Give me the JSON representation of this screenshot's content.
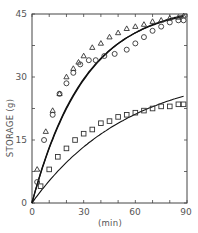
{
  "chart_data": {
    "type": "scatter",
    "title": "",
    "xlabel": "(min)",
    "ylabel": "STORAGE (g)",
    "xlim": [
      0,
      90
    ],
    "ylim": [
      0,
      45
    ],
    "xticks": [
      0,
      30,
      60,
      90
    ],
    "yticks": [
      0,
      15,
      30,
      45
    ],
    "grid": false,
    "legend": null,
    "series": [
      {
        "name": "triangles",
        "marker": "triangle",
        "points": [
          [
            3,
            8
          ],
          [
            8,
            17
          ],
          [
            12,
            22
          ],
          [
            16,
            26
          ],
          [
            20,
            30
          ],
          [
            24,
            32
          ],
          [
            27,
            33.5
          ],
          [
            30,
            35
          ],
          [
            35,
            37
          ],
          [
            40,
            38
          ],
          [
            45,
            39.5
          ],
          [
            50,
            40.5
          ],
          [
            55,
            41.5
          ],
          [
            60,
            42
          ],
          [
            65,
            42.5
          ],
          [
            70,
            43.2
          ],
          [
            75,
            43.5
          ],
          [
            80,
            44
          ],
          [
            85,
            44.2
          ],
          [
            88,
            44.5
          ]
        ]
      },
      {
        "name": "circles",
        "marker": "circle",
        "points": [
          [
            3,
            5
          ],
          [
            7,
            15
          ],
          [
            12,
            21
          ],
          [
            16,
            26
          ],
          [
            20,
            28.5
          ],
          [
            24,
            31
          ],
          [
            28,
            33
          ],
          [
            33,
            34
          ],
          [
            37,
            34
          ],
          [
            42,
            35
          ],
          [
            48,
            35.5
          ],
          [
            55,
            36.5
          ],
          [
            60,
            38
          ],
          [
            65,
            39.5
          ],
          [
            70,
            41
          ],
          [
            75,
            42
          ],
          [
            80,
            43
          ],
          [
            85,
            43.5
          ],
          [
            88,
            43.5
          ]
        ]
      },
      {
        "name": "squares",
        "marker": "square",
        "points": [
          [
            5,
            4
          ],
          [
            10,
            8
          ],
          [
            15,
            11
          ],
          [
            20,
            13
          ],
          [
            25,
            15
          ],
          [
            30,
            16.5
          ],
          [
            35,
            17.5
          ],
          [
            40,
            19
          ],
          [
            45,
            19.5
          ],
          [
            50,
            20.5
          ],
          [
            55,
            21
          ],
          [
            60,
            21.5
          ],
          [
            65,
            22
          ],
          [
            70,
            22.5
          ],
          [
            75,
            23
          ],
          [
            80,
            23
          ],
          [
            85,
            23.5
          ],
          [
            88,
            23.5
          ]
        ]
      }
    ],
    "fit_curves": [
      {
        "name": "upper-fit-1",
        "asymptote": 47,
        "rate": 0.033
      },
      {
        "name": "upper-fit-2",
        "asymptote": 47.5,
        "rate": 0.032
      },
      {
        "name": "lower-fit",
        "asymptote": 32,
        "rate": 0.018
      }
    ]
  },
  "axis": {
    "y_label": "STORAGE (g)",
    "x_label": "(min)",
    "y_ticks": [
      "0",
      "15",
      "30",
      "45"
    ],
    "x_ticks": [
      "0",
      "30",
      "60",
      "90"
    ]
  }
}
